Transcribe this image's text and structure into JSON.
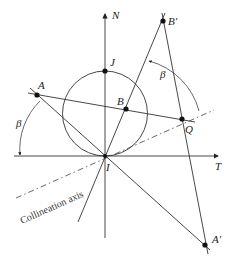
{
  "diagram": {
    "axes": {
      "vertical_label": "N",
      "horizontal_label": "T"
    },
    "points": {
      "A": "A",
      "B": "B",
      "J": "J",
      "Q": "Q",
      "I": "I",
      "B_prime": "B′",
      "A_prime": "A′"
    },
    "angles": {
      "beta_left": "β",
      "beta_right": "β"
    },
    "collineation_axis_label": "Collineation axis",
    "colors": {
      "stroke": "#333333",
      "background": "#ffffff"
    }
  }
}
